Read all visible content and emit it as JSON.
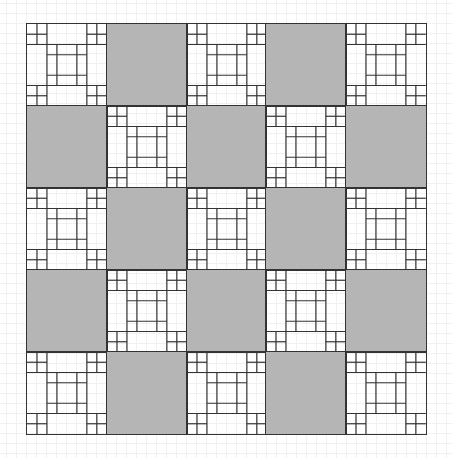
{
  "figure": {
    "type": "quilt-pattern",
    "rows": 5,
    "cols": 5,
    "layout": "checkerboard",
    "blocks": [
      [
        "pieced",
        "solid",
        "pieced",
        "solid",
        "pieced"
      ],
      [
        "solid",
        "pieced",
        "solid",
        "pieced",
        "solid"
      ],
      [
        "pieced",
        "solid",
        "pieced",
        "solid",
        "pieced"
      ],
      [
        "solid",
        "pieced",
        "solid",
        "pieced",
        "solid"
      ],
      [
        "pieced",
        "solid",
        "pieced",
        "solid",
        "pieced"
      ]
    ],
    "colors": {
      "solid": "#b5b5b5",
      "pieced": "#ffffff",
      "seam": "#333333",
      "background_grid": "#f1f1f1"
    },
    "pieced_block": {
      "description": "four-patch corners with framed center square",
      "corner_four_patch": true,
      "center": "square-in-a-square"
    }
  }
}
